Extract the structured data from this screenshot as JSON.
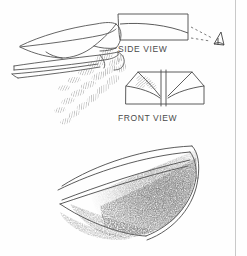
{
  "figure": {
    "type": "technical-line-drawing",
    "background_color": "#fefefe",
    "ink_color": "#4a4a4a",
    "labels": {
      "side_view": "SIDE VIEW",
      "front_view": "FRONT VIEW"
    },
    "panels": [
      {
        "name": "perspective-view",
        "description": "three-quarter perspective of swept delta wing with hatched vortex wake trailing below"
      },
      {
        "name": "side-view",
        "description": "orthographic side profile of wing with viewer eye symbol and dashed sight line"
      },
      {
        "name": "front-view",
        "description": "orthographic front profile showing vertical fin and swept chines with hatched vortex core"
      },
      {
        "name": "detail-view",
        "description": "large curved leading edge with dense stippled vortex sheet"
      }
    ],
    "annotations": {
      "eye_symbol": "observer viewpoint",
      "sight_line": "dashed line of sight"
    },
    "border": {
      "right_rule_color": "#c9c9c9"
    }
  }
}
